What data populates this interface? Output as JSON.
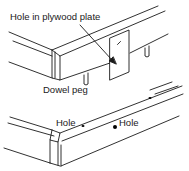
{
  "figure": {
    "type": "technical-line-drawing",
    "labels": {
      "plate_hole": "Hole in plywood plate",
      "dowel_peg": "Dowel peg",
      "hole_left": "Hole",
      "hole_right": "Hole"
    },
    "colors": {
      "line": "#1a1a1a",
      "background": "#ffffff"
    }
  }
}
